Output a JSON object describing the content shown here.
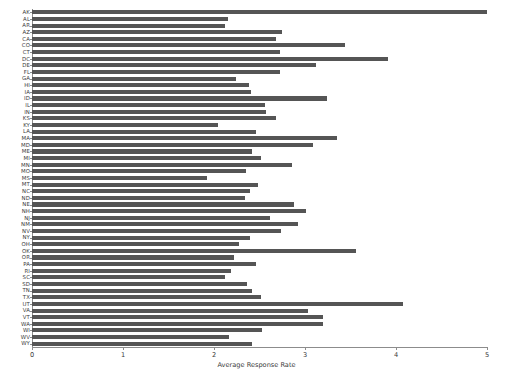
{
  "chart_data": {
    "type": "bar",
    "orientation": "horizontal",
    "title": "",
    "xlabel": "Average Response Rate",
    "ylabel": "",
    "xlim": [
      0,
      5
    ],
    "ylim": null,
    "grid": false,
    "legend": null,
    "bar_color": "#555555",
    "axis_color": "#8c8c8c",
    "xticks": [
      0,
      1,
      2,
      3,
      4,
      5
    ],
    "xtick_labels": [
      "0",
      "1",
      "2",
      "3",
      "4",
      "5"
    ],
    "categories": [
      "AK",
      "AL",
      "AR",
      "AZ",
      "CA",
      "CO",
      "CT",
      "DC",
      "DE",
      "FL",
      "GA",
      "HI",
      "IA",
      "ID",
      "IL",
      "IN",
      "KS",
      "KY",
      "LA",
      "MA",
      "MD",
      "ME",
      "MI",
      "MN",
      "MO",
      "MS",
      "MT",
      "NC",
      "ND",
      "NE",
      "NH",
      "NJ",
      "NM",
      "NV",
      "NY",
      "OH",
      "OK",
      "OR",
      "PA",
      "RI",
      "SC",
      "SD",
      "TN",
      "TX",
      "UT",
      "VA",
      "VT",
      "WA",
      "WI",
      "WV",
      "WY"
    ],
    "values": [
      5.03,
      2.15,
      2.12,
      2.75,
      2.68,
      3.44,
      2.72,
      3.91,
      3.12,
      2.72,
      2.24,
      2.38,
      2.41,
      3.24,
      2.56,
      2.57,
      2.68,
      2.04,
      2.46,
      3.35,
      3.09,
      2.42,
      2.52,
      2.86,
      2.35,
      1.92,
      2.48,
      2.4,
      2.34,
      2.88,
      3.01,
      2.62,
      2.92,
      2.74,
      2.4,
      2.27,
      3.56,
      2.22,
      2.46,
      2.19,
      2.12,
      2.36,
      2.42,
      2.52,
      4.08,
      3.03,
      3.2,
      3.2,
      2.53,
      2.16,
      2.42
    ]
  }
}
